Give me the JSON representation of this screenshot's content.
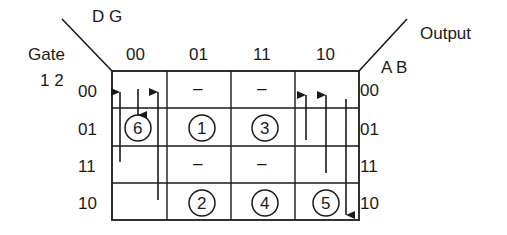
{
  "diagram": {
    "type": "state-flow-table",
    "labels": {
      "column_vars": "D G",
      "row_title": "Gate",
      "row_vars": "1 2",
      "output_title": "Output",
      "output_vars": "A B"
    },
    "columns": [
      "00",
      "01",
      "11",
      "10"
    ],
    "rows": [
      "00",
      "01",
      "11",
      "10"
    ],
    "output_rows": [
      "00",
      "01",
      "11",
      "10"
    ],
    "cells": [
      [
        "",
        "–",
        "–",
        ""
      ],
      [
        "6",
        "1",
        "3",
        ""
      ],
      [
        "",
        "–",
        "–",
        ""
      ],
      [
        "",
        "2",
        "4",
        "5"
      ]
    ],
    "stable_states": [
      {
        "id": "6",
        "row": 1,
        "col": 0
      },
      {
        "id": "1",
        "row": 1,
        "col": 1
      },
      {
        "id": "3",
        "row": 1,
        "col": 2
      },
      {
        "id": "2",
        "row": 3,
        "col": 1
      },
      {
        "id": "4",
        "row": 3,
        "col": 2
      },
      {
        "id": "5",
        "row": 3,
        "col": 3
      }
    ],
    "transitions": [
      {
        "col": 0,
        "direction": "up",
        "from_row": 2,
        "to_row": 0
      },
      {
        "col": 0,
        "direction": "down",
        "from_row": 0,
        "to_row": 1
      },
      {
        "col": 0,
        "direction": "up",
        "from_row": 3,
        "to_row": 0
      },
      {
        "col": 3,
        "direction": "up",
        "from_row": 1,
        "to_row": 0
      },
      {
        "col": 3,
        "direction": "up",
        "from_row": 2,
        "to_row": 0
      },
      {
        "col": 3,
        "direction": "down",
        "from_row": 0,
        "to_row": 3
      }
    ],
    "colors": {
      "ink": "#1a1a1a",
      "background": "#ffffff"
    }
  }
}
